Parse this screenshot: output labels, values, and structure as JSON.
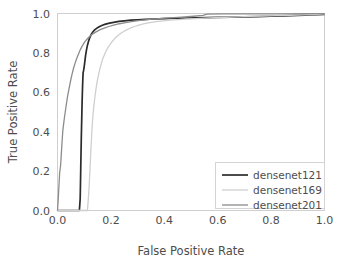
{
  "chart_data": {
    "type": "line",
    "title": "",
    "xlabel": "False Positive Rate",
    "ylabel": "True Positive Rate",
    "xlim": [
      0.0,
      1.0
    ],
    "ylim": [
      0.0,
      1.0
    ],
    "grid": false,
    "legend_position": "lower right",
    "xticks": [
      "0.0",
      "0.2",
      "0.4",
      "0.6",
      "0.8",
      "1.0"
    ],
    "xtick_values": [
      0.0,
      0.2,
      0.4,
      0.6,
      0.8,
      1.0
    ],
    "yticks": [
      "0.0",
      "0.2",
      "0.4",
      "0.6",
      "0.8",
      "1.0"
    ],
    "ytick_values": [
      0.0,
      0.2,
      0.4,
      0.6,
      0.8,
      1.0
    ],
    "series": [
      {
        "name": "densenet121",
        "color": "#2b2b2b",
        "linewidth": 1.7,
        "x": [
          0.0,
          0.082,
          0.085,
          0.086,
          0.087,
          0.088,
          0.089,
          0.09,
          0.091,
          0.092,
          0.093,
          0.094,
          0.095,
          0.096,
          0.097,
          0.098,
          0.1,
          0.102,
          0.104,
          0.106,
          0.109,
          0.112,
          0.116,
          0.12,
          0.126,
          0.132,
          0.14,
          0.148,
          0.158,
          0.168,
          0.18,
          0.195,
          0.21,
          0.23,
          0.25,
          0.275,
          0.3,
          0.33,
          0.36,
          0.4,
          0.44,
          0.48,
          0.52,
          0.56,
          0.6,
          0.65,
          0.7,
          0.75,
          0.8,
          0.85,
          0.9,
          0.95,
          1.0
        ],
        "y": [
          0.0,
          0.0,
          0.06,
          0.13,
          0.21,
          0.285,
          0.355,
          0.42,
          0.48,
          0.54,
          0.59,
          0.635,
          0.672,
          0.7,
          0.706,
          0.712,
          0.73,
          0.752,
          0.775,
          0.795,
          0.818,
          0.838,
          0.858,
          0.875,
          0.893,
          0.906,
          0.918,
          0.926,
          0.934,
          0.94,
          0.946,
          0.951,
          0.955,
          0.96,
          0.963,
          0.966,
          0.968,
          0.97,
          0.972,
          0.974,
          0.976,
          0.977,
          0.978,
          0.979,
          0.98,
          0.982,
          0.983,
          0.984,
          0.986,
          0.988,
          0.99,
          0.993,
          0.996
        ]
      },
      {
        "name": "densenet169",
        "color": "#cfcfcf",
        "linewidth": 1.3,
        "x": [
          0.0,
          0.112,
          0.115,
          0.118,
          0.12,
          0.122,
          0.124,
          0.126,
          0.128,
          0.13,
          0.133,
          0.136,
          0.14,
          0.144,
          0.148,
          0.153,
          0.158,
          0.164,
          0.17,
          0.178,
          0.186,
          0.195,
          0.205,
          0.215,
          0.228,
          0.24,
          0.255,
          0.27,
          0.288,
          0.305,
          0.325,
          0.345,
          0.37,
          0.395,
          0.42,
          0.45,
          0.48,
          0.515,
          0.55,
          0.59,
          0.63,
          0.675,
          0.72,
          0.77,
          0.82,
          0.87,
          0.92,
          0.96,
          1.0
        ],
        "y": [
          0.0,
          0.0,
          0.05,
          0.11,
          0.165,
          0.22,
          0.275,
          0.33,
          0.385,
          0.435,
          0.485,
          0.53,
          0.575,
          0.615,
          0.65,
          0.685,
          0.715,
          0.745,
          0.772,
          0.798,
          0.82,
          0.84,
          0.858,
          0.874,
          0.89,
          0.902,
          0.914,
          0.924,
          0.934,
          0.941,
          0.948,
          0.954,
          0.959,
          0.963,
          0.966,
          0.969,
          0.972,
          0.974,
          0.977,
          0.979,
          0.981,
          0.983,
          0.985,
          0.987,
          0.989,
          0.991,
          0.993,
          0.995,
          0.998
        ]
      },
      {
        "name": "densenet201",
        "color": "#8c8c8c",
        "linewidth": 1.3,
        "x": [
          0.0,
          0.002,
          0.004,
          0.006,
          0.008,
          0.01,
          0.012,
          0.014,
          0.016,
          0.018,
          0.02,
          0.023,
          0.026,
          0.029,
          0.032,
          0.035,
          0.038,
          0.042,
          0.046,
          0.05,
          0.055,
          0.06,
          0.066,
          0.072,
          0.079,
          0.086,
          0.094,
          0.102,
          0.112,
          0.122,
          0.134,
          0.146,
          0.16,
          0.175,
          0.192,
          0.21,
          0.232,
          0.255,
          0.282,
          0.31,
          0.345,
          0.38,
          0.42,
          0.465,
          0.51,
          0.545,
          0.56,
          0.62,
          0.68,
          0.74,
          0.8,
          0.86,
          0.92,
          1.0
        ],
        "y": [
          0.0,
          0.04,
          0.09,
          0.14,
          0.19,
          0.212,
          0.235,
          0.28,
          0.325,
          0.368,
          0.405,
          0.44,
          0.472,
          0.5,
          0.528,
          0.556,
          0.582,
          0.61,
          0.638,
          0.665,
          0.695,
          0.722,
          0.748,
          0.772,
          0.796,
          0.818,
          0.838,
          0.856,
          0.872,
          0.886,
          0.898,
          0.908,
          0.918,
          0.926,
          0.934,
          0.941,
          0.948,
          0.954,
          0.96,
          0.965,
          0.97,
          0.974,
          0.978,
          0.982,
          0.986,
          0.99,
          0.997,
          0.998,
          0.998,
          0.998,
          0.998,
          0.998,
          0.999,
          0.999
        ]
      }
    ]
  },
  "legend": {
    "entries": [
      {
        "label": "densenet121"
      },
      {
        "label": "densenet169"
      },
      {
        "label": "densenet201"
      }
    ]
  },
  "axes": {
    "x_title": "False Positive Rate",
    "y_title": "True Positive Rate"
  }
}
